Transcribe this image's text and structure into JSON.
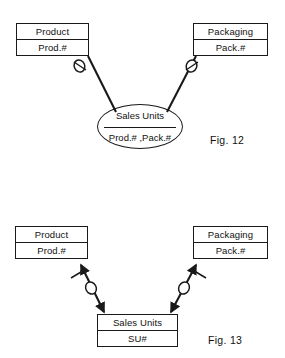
{
  "document": {
    "title": "Entity-Relationship Diagrams",
    "background_color": "#ffffff",
    "line_color": "#1a1a1a",
    "text_color": "#111111"
  },
  "figures": [
    {
      "id": "fig-12",
      "caption": "Fig. 12",
      "notation": "optional-relationship-ellipse",
      "entities": [
        {
          "id": "product",
          "name": "Product",
          "attribute": "Prod.#",
          "position": {
            "x": 16,
            "y": 23,
            "width": 73,
            "height": 33
          }
        },
        {
          "id": "packaging",
          "name": "Packaging",
          "attribute": "Pack.#",
          "position": {
            "x": 193,
            "y": 23,
            "width": 75,
            "height": 33
          }
        }
      ],
      "relationship": {
        "id": "sales-units",
        "name": "Sales Units",
        "attribute": "Prod.# ,Pack.#",
        "position": {
          "x": 97,
          "y": 104,
          "width": 86,
          "height": 45
        }
      },
      "connectors": [
        {
          "id": "product-to-sales-units",
          "from": "product",
          "to": "sales-units",
          "marker": "optionality-circle",
          "arrowheads": "none"
        },
        {
          "id": "packaging-to-sales-units",
          "from": "packaging",
          "to": "sales-units",
          "marker": "optionality-circle",
          "arrowheads": "none"
        }
      ]
    },
    {
      "id": "fig-13",
      "caption": "Fig. 13",
      "notation": "bidirectional-arrow-entity-box",
      "entities": [
        {
          "id": "product",
          "name": "Product",
          "attribute": "Prod.#",
          "position": {
            "x": 15,
            "y": 226,
            "width": 73,
            "height": 33
          }
        },
        {
          "id": "packaging",
          "name": "Packaging",
          "attribute": "Pack.#",
          "position": {
            "x": 193,
            "y": 226,
            "width": 75,
            "height": 33
          }
        },
        {
          "id": "sales-units",
          "name": "Sales Units",
          "attribute": "SU#",
          "position": {
            "x": 97,
            "y": 314,
            "width": 81,
            "height": 33
          }
        }
      ],
      "connectors": [
        {
          "id": "product-sales-units-arrow",
          "from": "sales-units",
          "to": "product",
          "marker": "optionality-circle",
          "tick": "mandatory-bar",
          "arrowheads": "double"
        },
        {
          "id": "packaging-sales-units-arrow",
          "from": "sales-units",
          "to": "packaging",
          "marker": "optionality-circle",
          "tick": "mandatory-bar",
          "arrowheads": "double"
        }
      ]
    }
  ]
}
